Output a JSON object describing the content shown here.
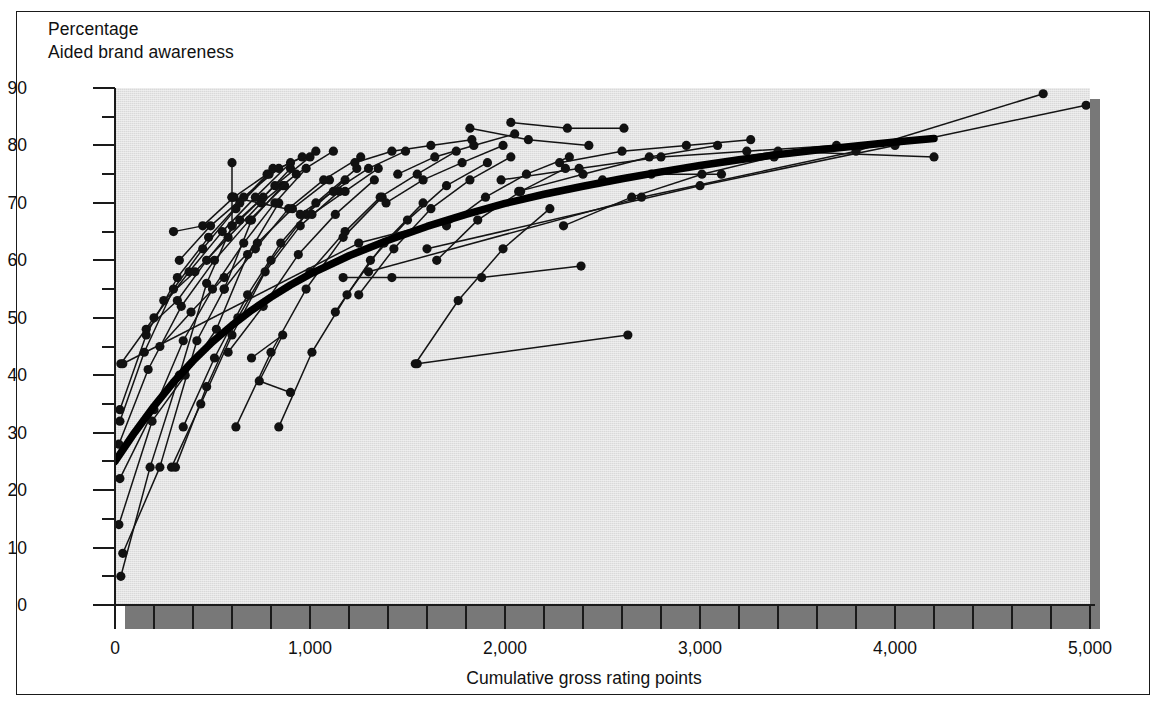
{
  "figure": {
    "y_axis_title_line1": "Percentage",
    "y_axis_title_line2": "Aided brand awareness",
    "x_axis_title": "Cumulative gross rating points",
    "colors": {
      "plot_background": "#d9d9d9",
      "shadow": "#787878",
      "ink": "#1a1a1a",
      "page": "#ffffff"
    }
  },
  "chart_data": {
    "type": "scatter",
    "title": "",
    "subtitle": "",
    "xlabel": "Cumulative gross rating points",
    "ylabel": "Aided brand awareness",
    "ylabel_unit": "Percentage",
    "xlim": [
      0,
      5000
    ],
    "ylim": [
      0,
      90
    ],
    "grid": false,
    "legend": null,
    "x_ticks_major": [
      0,
      1000,
      2000,
      3000,
      4000,
      5000
    ],
    "x_tick_labels": [
      "0",
      "1,000",
      "2,000",
      "3,000",
      "4,000",
      "5,000"
    ],
    "x_tick_minor_step": 200,
    "y_ticks_major": [
      0,
      10,
      20,
      30,
      40,
      50,
      60,
      70,
      80,
      90
    ],
    "y_tick_labels": [
      "0",
      "10",
      "20",
      "30",
      "40",
      "50",
      "60",
      "70",
      "80",
      "90"
    ],
    "y_tick_minor_step": 5,
    "marker": "filled-circle",
    "fitted_curve": {
      "name": "Fitted response curve",
      "style": "thick-black-line",
      "points": [
        [
          0,
          25.0
        ],
        [
          100,
          30.0
        ],
        [
          200,
          34.6
        ],
        [
          300,
          38.8
        ],
        [
          400,
          42.5
        ],
        [
          500,
          45.8
        ],
        [
          600,
          48.7
        ],
        [
          700,
          51.3
        ],
        [
          800,
          53.6
        ],
        [
          900,
          55.7
        ],
        [
          1000,
          57.6
        ],
        [
          1200,
          60.8
        ],
        [
          1400,
          63.5
        ],
        [
          1600,
          65.9
        ],
        [
          1800,
          68.0
        ],
        [
          2000,
          69.9
        ],
        [
          2200,
          71.5
        ],
        [
          2400,
          72.9
        ],
        [
          2600,
          74.2
        ],
        [
          2800,
          75.4
        ],
        [
          3000,
          76.5
        ],
        [
          3200,
          77.5
        ],
        [
          3400,
          78.4
        ],
        [
          3600,
          79.2
        ],
        [
          3800,
          79.9
        ],
        [
          4000,
          80.6
        ],
        [
          4200,
          81.2
        ]
      ]
    },
    "series": [
      {
        "name": "brand-01",
        "points": [
          [
            30,
            5
          ],
          [
            180,
            24
          ],
          [
            330,
            40
          ],
          [
            470,
            56
          ],
          [
            600,
            66
          ],
          [
            760,
            71
          ],
          [
            900,
            76
          ]
        ]
      },
      {
        "name": "brand-02",
        "points": [
          [
            40,
            9
          ],
          [
            230,
            24
          ],
          [
            420,
            46
          ],
          [
            560,
            55
          ],
          [
            700,
            67
          ],
          [
            860,
            73
          ]
        ]
      },
      {
        "name": "brand-03",
        "points": [
          [
            20,
            14
          ],
          [
            190,
            32
          ],
          [
            360,
            40
          ],
          [
            520,
            48
          ],
          [
            680,
            61
          ],
          [
            840,
            70
          ]
        ]
      },
      {
        "name": "brand-04",
        "points": [
          [
            25,
            22
          ],
          [
            200,
            34
          ],
          [
            350,
            46
          ],
          [
            500,
            55
          ],
          [
            660,
            63
          ],
          [
            820,
            70
          ],
          [
            980,
            76
          ]
        ]
      },
      {
        "name": "brand-05",
        "points": [
          [
            20,
            28
          ],
          [
            170,
            41
          ],
          [
            340,
            52
          ],
          [
            510,
            60
          ],
          [
            690,
            67
          ],
          [
            870,
            73
          ]
        ]
      },
      {
        "name": "brand-06",
        "points": [
          [
            25,
            32
          ],
          [
            150,
            44
          ],
          [
            300,
            55
          ],
          [
            450,
            62
          ],
          [
            620,
            69
          ],
          [
            790,
            75
          ]
        ]
      },
      {
        "name": "brand-07",
        "points": [
          [
            25,
            34
          ],
          [
            160,
            47
          ],
          [
            320,
            57
          ],
          [
            480,
            64
          ],
          [
            640,
            70
          ],
          [
            810,
            76
          ]
        ]
      },
      {
        "name": "brand-08",
        "points": [
          [
            30,
            42
          ],
          [
            200,
            50
          ],
          [
            380,
            58
          ],
          [
            550,
            65
          ],
          [
            720,
            71
          ],
          [
            900,
            77
          ]
        ]
      },
      {
        "name": "brand-09",
        "points": [
          [
            160,
            48
          ],
          [
            320,
            53
          ],
          [
            470,
            60
          ],
          [
            640,
            67
          ],
          [
            820,
            73
          ],
          [
            1000,
            78
          ]
        ]
      },
      {
        "name": "brand-10",
        "points": [
          [
            250,
            53
          ],
          [
            410,
            58
          ],
          [
            580,
            64
          ],
          [
            750,
            70
          ],
          [
            930,
            75
          ],
          [
            1120,
            79
          ]
        ]
      },
      {
        "name": "brand-11",
        "points": [
          [
            230,
            45
          ],
          [
            390,
            51
          ],
          [
            560,
            57
          ],
          [
            730,
            63
          ],
          [
            910,
            69
          ],
          [
            1100,
            74
          ]
        ]
      },
      {
        "name": "brand-12",
        "points": [
          [
            290,
            24
          ],
          [
            440,
            35
          ],
          [
            600,
            47
          ],
          [
            770,
            58
          ],
          [
            950,
            66
          ],
          [
            1150,
            72
          ]
        ]
      },
      {
        "name": "brand-13",
        "points": [
          [
            310,
            24
          ],
          [
            470,
            38
          ],
          [
            630,
            50
          ],
          [
            800,
            60
          ],
          [
            980,
            68
          ],
          [
            1180,
            74
          ]
        ]
      },
      {
        "name": "brand-14",
        "points": [
          [
            350,
            31
          ],
          [
            510,
            43
          ],
          [
            680,
            54
          ],
          [
            850,
            63
          ],
          [
            1030,
            70
          ],
          [
            1240,
            76
          ]
        ]
      },
      {
        "name": "brand-15",
        "points": [
          [
            300,
            65
          ],
          [
            450,
            66
          ],
          [
            610,
            71
          ],
          [
            780,
            75
          ],
          [
            960,
            78
          ]
        ]
      },
      {
        "name": "brand-16",
        "points": [
          [
            330,
            60
          ],
          [
            490,
            66
          ],
          [
            660,
            71
          ],
          [
            840,
            76
          ],
          [
            1030,
            79
          ]
        ]
      },
      {
        "name": "brand-17",
        "points": [
          [
            600,
            77
          ],
          [
            600,
            71
          ],
          [
            600,
            66
          ]
        ]
      },
      {
        "name": "brand-18",
        "points": [
          [
            600,
            71
          ],
          [
            1010,
            68
          ],
          [
            1180,
            72
          ],
          [
            1350,
            76
          ]
        ]
      },
      {
        "name": "brand-19",
        "points": [
          [
            560,
            55
          ],
          [
            720,
            62
          ],
          [
            890,
            69
          ],
          [
            1070,
            74
          ],
          [
            1260,
            78
          ]
        ]
      },
      {
        "name": "brand-20",
        "points": [
          [
            580,
            44
          ],
          [
            760,
            52
          ],
          [
            940,
            61
          ],
          [
            1130,
            68
          ],
          [
            1330,
            74
          ]
        ]
      },
      {
        "name": "brand-21",
        "points": [
          [
            620,
            31
          ],
          [
            800,
            44
          ],
          [
            980,
            55
          ],
          [
            1170,
            64
          ],
          [
            1370,
            71
          ]
        ]
      },
      {
        "name": "brand-22",
        "points": [
          [
            700,
            43
          ],
          [
            860,
            47
          ],
          [
            740,
            39
          ],
          [
            900,
            37
          ]
        ]
      },
      {
        "name": "brand-23",
        "points": [
          [
            840,
            31
          ],
          [
            1010,
            44
          ],
          [
            1190,
            54
          ],
          [
            1380,
            63
          ],
          [
            1580,
            70
          ]
        ]
      },
      {
        "name": "brand-24",
        "points": [
          [
            950,
            68
          ],
          [
            1120,
            72
          ],
          [
            1300,
            76
          ],
          [
            1490,
            79
          ]
        ]
      },
      {
        "name": "brand-25",
        "points": [
          [
            1000,
            58
          ],
          [
            1180,
            65
          ],
          [
            1360,
            71
          ],
          [
            1550,
            75
          ],
          [
            1750,
            79
          ]
        ]
      },
      {
        "name": "brand-26",
        "points": [
          [
            1130,
            51
          ],
          [
            1310,
            60
          ],
          [
            1500,
            67
          ],
          [
            1700,
            73
          ],
          [
            1910,
            77
          ]
        ]
      },
      {
        "name": "brand-27",
        "points": [
          [
            1250,
            54
          ],
          [
            1430,
            62
          ],
          [
            1620,
            69
          ],
          [
            1820,
            74
          ],
          [
            2030,
            78
          ]
        ]
      },
      {
        "name": "brand-28",
        "points": [
          [
            1230,
            77
          ],
          [
            1420,
            79
          ],
          [
            1620,
            80
          ],
          [
            1830,
            81
          ]
        ]
      },
      {
        "name": "brand-29",
        "points": [
          [
            1450,
            75
          ],
          [
            1640,
            78
          ],
          [
            1840,
            80
          ],
          [
            2050,
            82
          ]
        ]
      },
      {
        "name": "brand-30",
        "points": [
          [
            1390,
            70
          ],
          [
            1580,
            74
          ],
          [
            1780,
            77
          ],
          [
            1990,
            80
          ]
        ]
      },
      {
        "name": "brand-31",
        "points": [
          [
            1700,
            66
          ],
          [
            1900,
            71
          ],
          [
            2110,
            75
          ],
          [
            2330,
            78
          ]
        ]
      },
      {
        "name": "brand-32",
        "points": [
          [
            1650,
            60
          ],
          [
            1860,
            67
          ],
          [
            2080,
            72
          ],
          [
            2310,
            76
          ]
        ]
      },
      {
        "name": "brand-33",
        "points": [
          [
            1540,
            42
          ],
          [
            1760,
            53
          ],
          [
            1990,
            62
          ],
          [
            2230,
            69
          ]
        ]
      },
      {
        "name": "brand-34",
        "points": [
          [
            1170,
            57
          ],
          [
            1420,
            57
          ],
          [
            1880,
            57
          ],
          [
            2390,
            59
          ]
        ]
      },
      {
        "name": "brand-35",
        "points": [
          [
            1550,
            42
          ],
          [
            2630,
            47
          ]
        ]
      },
      {
        "name": "brand-36",
        "points": [
          [
            2030,
            84
          ],
          [
            2320,
            83
          ],
          [
            2610,
            83
          ]
        ]
      },
      {
        "name": "brand-37",
        "points": [
          [
            1820,
            83
          ],
          [
            2120,
            81
          ],
          [
            2430,
            80
          ]
        ]
      },
      {
        "name": "brand-38",
        "points": [
          [
            2280,
            77
          ],
          [
            2600,
            79
          ],
          [
            2930,
            80
          ],
          [
            3260,
            81
          ]
        ]
      },
      {
        "name": "brand-39",
        "points": [
          [
            2070,
            72
          ],
          [
            2400,
            75
          ],
          [
            2740,
            78
          ],
          [
            3090,
            80
          ]
        ]
      },
      {
        "name": "brand-40",
        "points": [
          [
            2300,
            66
          ],
          [
            2650,
            71
          ],
          [
            3010,
            75
          ],
          [
            3380,
            78
          ]
        ]
      },
      {
        "name": "brand-41",
        "points": [
          [
            2750,
            75
          ],
          [
            3110,
            75
          ]
        ]
      },
      {
        "name": "brand-42",
        "points": [
          [
            1980,
            74
          ],
          [
            2380,
            76
          ],
          [
            2800,
            78
          ],
          [
            3240,
            79
          ],
          [
            3700,
            80
          ]
        ]
      },
      {
        "name": "brand-43",
        "points": [
          [
            40,
            42
          ],
          [
            1250,
            63
          ],
          [
            2500,
            74
          ],
          [
            3400,
            79
          ],
          [
            4200,
            78
          ]
        ]
      },
      {
        "name": "brand-44",
        "points": [
          [
            1300,
            58
          ],
          [
            2700,
            71
          ],
          [
            3800,
            79
          ],
          [
            4760,
            89
          ]
        ]
      },
      {
        "name": "brand-45",
        "points": [
          [
            1600,
            62
          ],
          [
            3000,
            73
          ],
          [
            4000,
            80
          ],
          [
            4980,
            87
          ]
        ]
      }
    ]
  }
}
